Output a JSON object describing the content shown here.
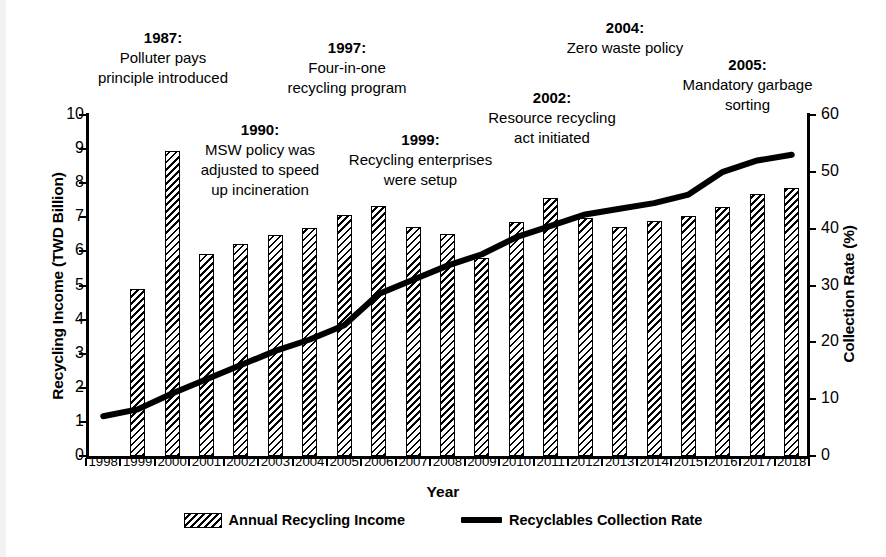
{
  "chart_data": {
    "type": "bar",
    "title": "",
    "xlabel": "Year",
    "ylabel": "Recycling Income (TWD Billion)",
    "y2label": "Collection Rate (%)",
    "ylim": [
      0,
      10
    ],
    "y2lim": [
      0,
      60
    ],
    "yticks": [
      "0",
      "1",
      "2",
      "3",
      "4",
      "5",
      "6",
      "7",
      "8",
      "9",
      "10"
    ],
    "y2ticks": [
      "0",
      "10",
      "20",
      "30",
      "40",
      "50",
      "60"
    ],
    "grid": false,
    "legend_position": "bottom",
    "categories": [
      "1998",
      "1999",
      "2000",
      "2001",
      "2002",
      "2003",
      "2004",
      "2005",
      "2006",
      "2007",
      "2008",
      "2009",
      "2010",
      "2011",
      "2012",
      "2013",
      "2014",
      "2015",
      "2016",
      "2017",
      "2018"
    ],
    "series": [
      {
        "name": "Annual Recycling Income",
        "type": "bar",
        "axis": "left",
        "unit": "TWD Billion",
        "values": [
          null,
          4.9,
          8.95,
          5.92,
          6.23,
          6.47,
          6.68,
          7.08,
          7.33,
          6.72,
          6.5,
          5.8,
          6.87,
          7.58,
          6.98,
          6.73,
          6.88,
          7.05,
          7.3,
          7.68,
          7.85
        ]
      },
      {
        "name": "Recyclables Collection Rate",
        "type": "line",
        "axis": "right",
        "unit": "%",
        "values": [
          7.0,
          8.2,
          11.0,
          13.5,
          16.0,
          18.5,
          20.5,
          23.0,
          28.5,
          31.0,
          33.5,
          35.5,
          38.5,
          40.5,
          42.5,
          43.5,
          44.5,
          46.0,
          50.0,
          52.0,
          53.0
        ]
      }
    ],
    "annotations": [
      {
        "year": "1987:",
        "text": "Polluter pays\nprinciple introduced"
      },
      {
        "year": "1990:",
        "text": "MSW policy was\nadjusted to speed\nup incineration"
      },
      {
        "year": "1997:",
        "text": "Four-in-one\nrecycling program"
      },
      {
        "year": "1999:",
        "text": "Recycling enterprises\nwere setup"
      },
      {
        "year": "2002:",
        "text": "Resource recycling\nact initiated"
      },
      {
        "year": "2004:",
        "text": "Zero waste policy"
      },
      {
        "year": "2005:",
        "text": "Mandatory garbage\nsorting"
      }
    ]
  },
  "legend": {
    "items": [
      {
        "label": "Annual Recycling Income",
        "marker": "hatched-bar-swatch"
      },
      {
        "label": "Recyclables Collection Rate",
        "marker": "solid-line-swatch"
      }
    ]
  }
}
